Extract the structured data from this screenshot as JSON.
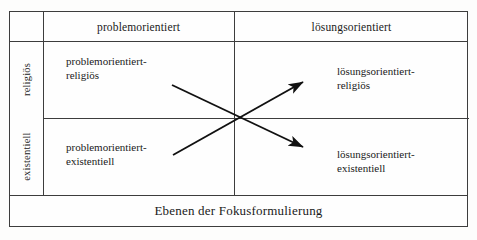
{
  "figure": {
    "caption": "Ebenen der Fokusformulierung",
    "columns": [
      {
        "key": "problem",
        "label": "problemorientiert"
      },
      {
        "key": "loesung",
        "label": "lösungsorientiert"
      }
    ],
    "rows": [
      {
        "key": "religioes",
        "label": "religiös"
      },
      {
        "key": "existentiell",
        "label": "existentiell"
      }
    ],
    "cells": {
      "top_left": {
        "line1": "problemorientiert-",
        "line2": "religiös"
      },
      "top_right": {
        "line1": "lösungsorientiert-",
        "line2": "religiös"
      },
      "bottom_left": {
        "line1": "problemorientiert-",
        "line2": "existentiell"
      },
      "bottom_right": {
        "line1": "lösungsorientiert-",
        "line2": "existentiell"
      }
    },
    "arrows": [
      {
        "name": "arrow-bottom-left-to-top-right",
        "from": "problemorientiert-existentiell",
        "to": "lösungsorientiert-religiös",
        "x1": 173,
        "y1": 155,
        "x2": 306,
        "y2": 80
      },
      {
        "name": "arrow-top-left-to-bottom-right",
        "from": "problemorientiert-religiös",
        "to": "lösungsorientiert-existentiell",
        "x1": 172,
        "y1": 85,
        "x2": 307,
        "y2": 149
      }
    ],
    "colors": {
      "stroke": "#3d3d3d",
      "arrow": "#111111",
      "text": "#1a1a1a",
      "background": "#fdfdfc"
    }
  }
}
